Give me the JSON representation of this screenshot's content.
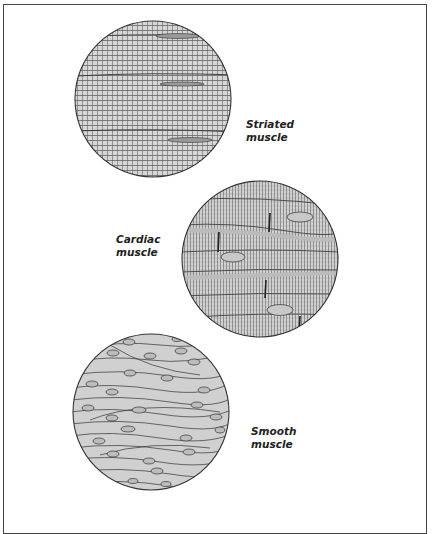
{
  "figure": {
    "panels": [
      {
        "id": "striated",
        "label_line1": "Striated",
        "label_line2": "muscle",
        "cx": 153,
        "cy": 99,
        "r": 78
      },
      {
        "id": "cardiac",
        "label_line1": "Cardiac",
        "label_line2": "muscle",
        "cx": 260,
        "cy": 259,
        "r": 78
      },
      {
        "id": "smooth",
        "label_line1": "Smooth",
        "label_line2": "muscle",
        "cx": 151,
        "cy": 412,
        "r": 78
      }
    ],
    "colors": {
      "tissue_fill": "#d4d4d4",
      "line": "#333333",
      "frame": "#444444",
      "background": "#ffffff"
    }
  }
}
